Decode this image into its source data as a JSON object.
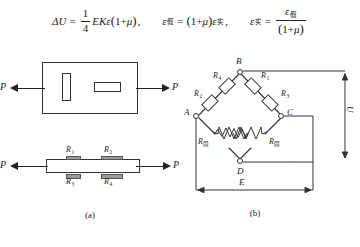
{
  "formulas": {
    "eq1": {
      "lhs_delta": "Δ",
      "lhs_u": "U",
      "equals": "=",
      "frac_num": "1",
      "frac_den": "4",
      "body_e": "E",
      "body_k": "K",
      "body_eps": "ε",
      "open": "(",
      "one_plus": "1+",
      "mu": "μ",
      "close": ")",
      "comma": ","
    },
    "eq2": {
      "eps": "ε",
      "sub_apparent": "假",
      "equals": "=",
      "open": "(",
      "one_plus": "1+",
      "mu": "μ",
      "close": ")",
      "eps2": "ε",
      "sub_actual": "实",
      "comma": ","
    },
    "eq3": {
      "eps": "ε",
      "sub_actual": "实",
      "equals": "=",
      "num_eps": "ε",
      "num_sub": "假",
      "den_open": "(",
      "den_one_plus": "1+",
      "den_mu": "μ",
      "den_close": ")"
    }
  },
  "figure_a": {
    "caption": "(a)",
    "force_left_label": "P",
    "force_right_label": "P",
    "force_left_label2": "P",
    "force_right_label2": "P",
    "gauge_vertical_name": "strain-gauge-vertical",
    "gauge_horizontal_name": "strain-gauge-horizontal",
    "strip_gauges": [
      {
        "label": "R",
        "sub": "1",
        "position": "top-left"
      },
      {
        "label": "R",
        "sub": "2",
        "position": "top-right"
      },
      {
        "label": "R",
        "sub": "3",
        "position": "bottom-left"
      },
      {
        "label": "R",
        "sub": "4",
        "position": "bottom-right"
      }
    ]
  },
  "figure_b": {
    "caption": "(b)",
    "nodes": [
      {
        "id": "A",
        "label": "A"
      },
      {
        "id": "B",
        "label": "B"
      },
      {
        "id": "C",
        "label": "C"
      },
      {
        "id": "D",
        "label": "D"
      }
    ],
    "bridge_resistors": [
      {
        "label": "R",
        "sub": "4",
        "arm": "upper-left"
      },
      {
        "label": "R",
        "sub": "2",
        "arm": "lower-left"
      },
      {
        "label": "R",
        "sub": "1",
        "arm": "upper-right"
      },
      {
        "label": "R",
        "sub": "3",
        "arm": "lower-right"
      }
    ],
    "fixed_resistors": [
      {
        "label": "R",
        "sub": "固",
        "arm": "lower-left-zigzag"
      },
      {
        "label": "R",
        "sub": "固",
        "arm": "lower-right-zigzag"
      }
    ],
    "source_label": "E",
    "output_label": "U"
  }
}
